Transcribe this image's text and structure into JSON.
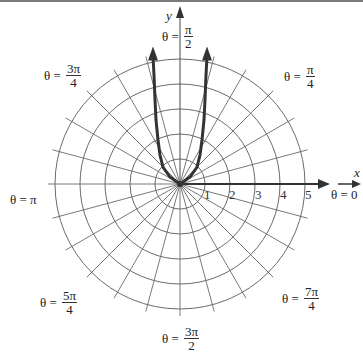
{
  "diagram": {
    "type": "polar-grid-plot",
    "center_px": [
      180,
      184
    ],
    "ring_spacing_px": 25,
    "rings": [
      1,
      2,
      3,
      4,
      5
    ],
    "spoke_step_degrees": 15,
    "axes": {
      "x_label": "x",
      "y_label": "y"
    },
    "radial_tick_labels": [
      "1",
      "2",
      "3",
      "4",
      "5"
    ],
    "angle_labels": [
      {
        "id": "theta-0",
        "prefix": "θ = ",
        "value": "0"
      },
      {
        "id": "theta-pi-4",
        "prefix": "θ = ",
        "num": "π",
        "den": "4"
      },
      {
        "id": "theta-pi-2",
        "prefix": "θ = ",
        "num": "π",
        "den": "2"
      },
      {
        "id": "theta-3pi-4",
        "prefix": "θ = ",
        "num": "3π",
        "den": "4"
      },
      {
        "id": "theta-pi",
        "prefix": "θ = ",
        "value": "π"
      },
      {
        "id": "theta-5pi-4",
        "prefix": "θ = ",
        "num": "5π",
        "den": "4"
      },
      {
        "id": "theta-3pi-2",
        "prefix": "θ = ",
        "num": "3π",
        "den": "2"
      },
      {
        "id": "theta-7pi-4",
        "prefix": "θ = ",
        "num": "7π",
        "den": "4"
      }
    ],
    "curve": {
      "description": "U-shaped polar curve through the origin, symmetric about the y-axis, both branches rising toward x = ±1 with arrowheads at the top",
      "right_branch_xy": [
        [
          0,
          0
        ],
        [
          0.4,
          0.28
        ],
        [
          0.68,
          0.68
        ],
        [
          0.8,
          1.16
        ],
        [
          0.88,
          1.76
        ],
        [
          0.96,
          2.56
        ],
        [
          1.0,
          3.36
        ],
        [
          1.04,
          4.36
        ],
        [
          1.08,
          5.1
        ]
      ],
      "color": "#333333"
    },
    "colors": {
      "grid": "#555555",
      "axis": "#333333",
      "curve": "#3a3a3a",
      "background": "#ffffff"
    }
  }
}
